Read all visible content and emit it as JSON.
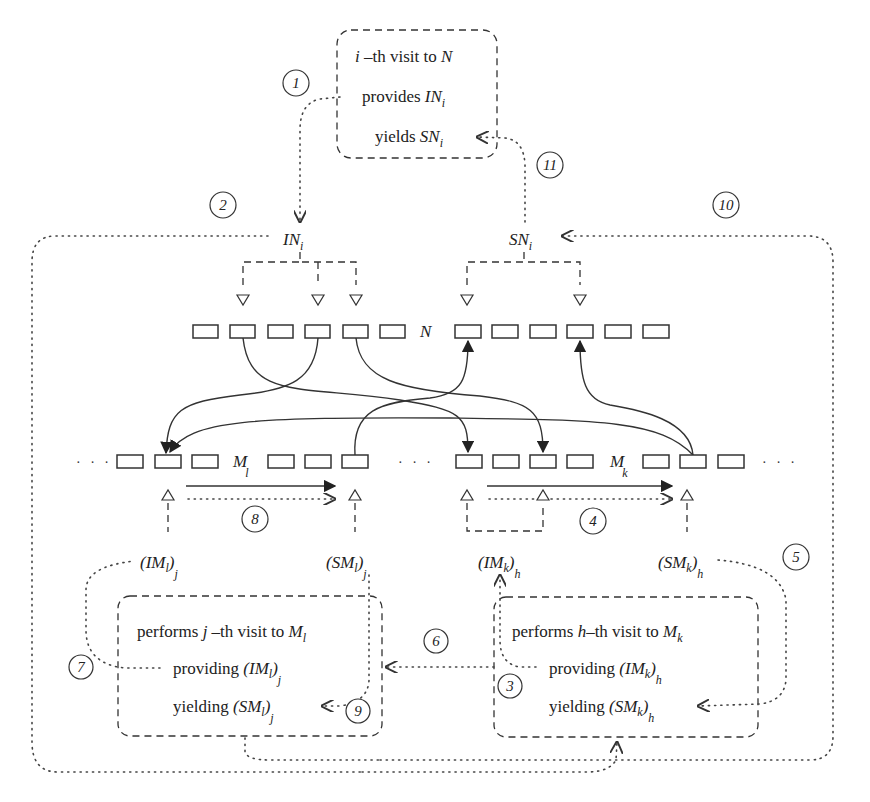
{
  "diagram": {
    "top_box": {
      "line1": {
        "var": "i",
        "text": " –th visit to ",
        "target": "N"
      },
      "line2": {
        "text": "provides ",
        "sym": "IN",
        "sub": "i"
      },
      "line3": {
        "text": "yields ",
        "sym": "SN",
        "sub": "i"
      }
    },
    "labels": {
      "IN": {
        "sym": "IN",
        "sub": "i"
      },
      "SN": {
        "sym": "SN",
        "sub": "i"
      },
      "N_row": "N",
      "Ml": {
        "sym": "M",
        "sub": "l"
      },
      "Mk": {
        "sym": "M",
        "sub": "k"
      },
      "IMl": {
        "open": "(IM",
        "inner": "l",
        "close": ")",
        "sub": "j"
      },
      "SMl": {
        "open": "(SM",
        "inner": "l",
        "close": ")",
        "sub": "j"
      },
      "IMk": {
        "open": "(IM",
        "inner": "k",
        "close": ")",
        "sub": "h"
      },
      "SMk": {
        "open": "(SM",
        "inner": "k",
        "close": ")",
        "sub": "h"
      },
      "ellipsis": "· · ·"
    },
    "left_box": {
      "line1": {
        "text": "performs ",
        "var": "j",
        "rest": " –th visit to ",
        "sym": "M",
        "sub": "l"
      },
      "line2": {
        "text": "providing ",
        "open": "(IM",
        "inner": "l",
        "close": ")",
        "sub": "j"
      },
      "line3": {
        "text": "yielding ",
        "open": "(SM",
        "inner": "l",
        "close": ")",
        "sub": "j"
      }
    },
    "right_box": {
      "line1": {
        "text": "performs ",
        "var": "h",
        "rest": "–th visit to ",
        "sym": "M",
        "sub": "k"
      },
      "line2": {
        "text": "providing ",
        "open": "(IM",
        "inner": "k",
        "close": ")",
        "sub": "h"
      },
      "line3": {
        "text": "yielding ",
        "open": "(SM",
        "inner": "k",
        "close": ")",
        "sub": "h"
      }
    },
    "step_markers": [
      "1",
      "2",
      "3",
      "4",
      "5",
      "6",
      "7",
      "8",
      "9",
      "10",
      "11"
    ],
    "colors": {
      "ink": "#333333",
      "background": "#ffffff"
    }
  }
}
